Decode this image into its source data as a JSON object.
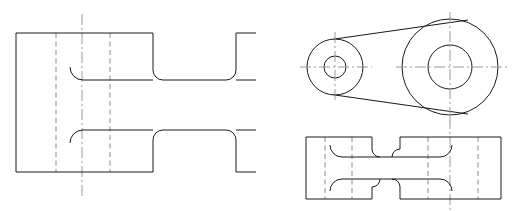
{
  "document": {
    "type": "engineering-drawing",
    "title": "Multiview Orthographic Projection — Connecting Link",
    "sheet_width": 512,
    "sheet_height": 211,
    "background_color": "#ffffff",
    "projection": "third-angle",
    "view_count": 3
  },
  "style": {
    "visible_edge_color": "#1a1a1a",
    "hidden_edge_color": "#8a8a8a",
    "center_line_color": "#9a9a9a",
    "line_width": 1,
    "hidden_dash": "5 3.5",
    "center_dash": "11 3 2 3"
  },
  "views": {
    "front": {
      "name": "front-section-view",
      "label": "",
      "origin_x": 16,
      "origin_y": 33,
      "outline_path": "M16,33 L153,33 L153,70 Q153,80 163,80 L226,80 Q236,80 236,70 L236,33 L256,33 M256,80 L236,80 M16,33 L16,172 L153,172 L153,140 Q153,130 163,130 L226,130 Q236,130 236,140 L236,172 L256,172 M256,130 L236,130",
      "segments": [
        {
          "name": "top-edge-left",
          "type": "line",
          "x1": 16,
          "y1": 33,
          "x2": 153,
          "y2": 33
        },
        {
          "name": "bottom-edge-left",
          "type": "line",
          "x1": 16,
          "y1": 172,
          "x2": 153,
          "y2": 172
        },
        {
          "name": "left-edge",
          "type": "line",
          "x1": 16,
          "y1": 33,
          "x2": 16,
          "y2": 172
        },
        {
          "name": "upper-step-vertical",
          "type": "line",
          "x1": 153,
          "y1": 33,
          "x2": 153,
          "y2": 72
        },
        {
          "name": "upper-step-fillet",
          "type": "arc",
          "cx": 163,
          "cy": 70,
          "r": 10
        },
        {
          "name": "upper-waist-line",
          "type": "line",
          "x1": 163,
          "y1": 80,
          "x2": 226,
          "y2": 80
        },
        {
          "name": "upper-rise-fillet",
          "type": "arc",
          "cx": 226,
          "cy": 70,
          "r": 10
        },
        {
          "name": "upper-rise-vertical",
          "type": "line",
          "x1": 236,
          "y1": 70,
          "x2": 236,
          "y2": 33
        },
        {
          "name": "upper-right-top",
          "type": "line",
          "x1": 236,
          "y1": 33,
          "x2": 256,
          "y2": 33
        },
        {
          "name": "upper-right-waist",
          "type": "line",
          "x1": 236,
          "y1": 80,
          "x2": 256,
          "y2": 80
        },
        {
          "name": "lower-step-vertical",
          "type": "line",
          "x1": 153,
          "y1": 172,
          "x2": 153,
          "y2": 140
        },
        {
          "name": "lower-step-fillet",
          "type": "arc",
          "cx": 163,
          "cy": 140,
          "r": 10
        },
        {
          "name": "lower-waist-line",
          "type": "line",
          "x1": 163,
          "y1": 130,
          "x2": 226,
          "y2": 130
        },
        {
          "name": "lower-rise-fillet",
          "type": "arc",
          "cx": 226,
          "cy": 140,
          "r": 10
        },
        {
          "name": "lower-rise-vertical",
          "type": "line",
          "x1": 236,
          "y1": 140,
          "x2": 236,
          "y2": 172
        },
        {
          "name": "lower-right-bottom",
          "type": "line",
          "x1": 236,
          "y1": 172,
          "x2": 256,
          "y2": 172
        },
        {
          "name": "lower-right-waist",
          "type": "line",
          "x1": 236,
          "y1": 130,
          "x2": 256,
          "y2": 130
        }
      ],
      "hidden_edges": [
        {
          "name": "hidden-bore-left",
          "x": 56,
          "y1": 33,
          "y2": 172
        },
        {
          "name": "hidden-bore-right",
          "x": 110,
          "y1": 33,
          "y2": 172
        }
      ],
      "interior_fillets": [
        {
          "name": "interior-upper-fillet",
          "cx": 70,
          "cy": 80,
          "r": 10,
          "start_deg": 270,
          "end_deg": 360
        },
        {
          "name": "interior-lower-fillet",
          "cx": 70,
          "cy": 130,
          "r": 10,
          "start_deg": 0,
          "end_deg": 90
        }
      ],
      "interior_lines": [
        {
          "name": "interior-upper-waist",
          "x1": 80,
          "y1": 80,
          "x2": 153,
          "y2": 80
        },
        {
          "name": "interior-lower-waist",
          "x1": 80,
          "y1": 130,
          "x2": 153,
          "y2": 130
        }
      ],
      "center_lines": [
        {
          "name": "front-vertical-centerline",
          "x1": 82,
          "y1": 14,
          "x2": 82,
          "y2": 196
        }
      ]
    },
    "top": {
      "name": "top-plan-view",
      "label": "",
      "small_hub": {
        "name": "small-hub",
        "center_x": 335,
        "center_y": 67,
        "outer_radius": 28,
        "bore_radius": 11
      },
      "large_hub": {
        "name": "large-hub",
        "center_x": 450,
        "center_y": 67,
        "outer_radius": 48,
        "bore_radius": 22
      },
      "tangent_lines": [
        {
          "name": "upper-tangent-web",
          "x1": 334,
          "y1": 39,
          "x2": 467,
          "y2": 20
        },
        {
          "name": "lower-tangent-web",
          "x1": 334,
          "y1": 95,
          "x2": 467,
          "y2": 114
        }
      ],
      "center_lines": [
        {
          "name": "small-hub-horizontal-centerline",
          "x1": 301,
          "y1": 67,
          "x2": 372,
          "y2": 67
        },
        {
          "name": "small-hub-vertical-centerline",
          "x1": 335,
          "y1": 33,
          "x2": 335,
          "y2": 101
        },
        {
          "name": "large-hub-horizontal-centerline",
          "x1": 396,
          "y1": 67,
          "x2": 507,
          "y2": 67
        },
        {
          "name": "large-hub-vertical-centerline",
          "x1": 450,
          "y1": 13,
          "x2": 450,
          "y2": 121
        }
      ]
    },
    "side": {
      "name": "side-section-view",
      "label": "",
      "origin_x": 306,
      "origin_y": 137,
      "width": 195,
      "height": 62,
      "outline": {
        "x": 306,
        "y": 137,
        "w": 195,
        "h": 62
      },
      "segments": [
        {
          "name": "outer-top-left",
          "type": "line",
          "x1": 306,
          "y1": 137,
          "x2": 372,
          "y2": 137
        },
        {
          "name": "outer-top-right",
          "type": "line",
          "x1": 400,
          "y1": 137,
          "x2": 501,
          "y2": 137
        },
        {
          "name": "outer-bottom-left",
          "type": "line",
          "x1": 306,
          "y1": 199,
          "x2": 372,
          "y2": 199
        },
        {
          "name": "outer-bottom-right",
          "type": "line",
          "x1": 400,
          "y1": 199,
          "x2": 501,
          "y2": 199
        },
        {
          "name": "outer-left-edge",
          "type": "line",
          "x1": 306,
          "y1": 137,
          "x2": 306,
          "y2": 199
        },
        {
          "name": "outer-right-edge",
          "type": "line",
          "x1": 501,
          "y1": 137,
          "x2": 501,
          "y2": 199
        },
        {
          "name": "notch-left-vertical-upper",
          "type": "line",
          "x1": 372,
          "y1": 137,
          "x2": 372,
          "y2": 152
        },
        {
          "name": "notch-right-vertical-upper",
          "type": "line",
          "x1": 400,
          "y1": 137,
          "x2": 400,
          "y2": 152
        },
        {
          "name": "notch-left-vertical-lower",
          "type": "line",
          "x1": 372,
          "y1": 199,
          "x2": 372,
          "y2": 184
        },
        {
          "name": "notch-right-vertical-lower",
          "type": "line",
          "x1": 400,
          "y1": 199,
          "x2": 400,
          "y2": 184
        },
        {
          "name": "web-top-line",
          "type": "line",
          "x1": 338,
          "y1": 157,
          "x2": 451,
          "y2": 157
        },
        {
          "name": "web-bottom-line",
          "type": "line",
          "x1": 338,
          "y1": 179,
          "x2": 451,
          "y2": 179
        }
      ],
      "hidden_edges": [
        {
          "name": "hidden-line-a",
          "x": 325,
          "y1": 137,
          "y2": 199
        },
        {
          "name": "hidden-line-b",
          "x": 352,
          "y1": 137,
          "y2": 199
        },
        {
          "name": "hidden-line-c",
          "x": 428,
          "y1": 137,
          "y2": 199
        },
        {
          "name": "hidden-line-d",
          "x": 478,
          "y1": 137,
          "y2": 199
        }
      ],
      "center_lines": [
        {
          "name": "side-vertical-centerline",
          "x1": 450,
          "y1": 118,
          "x2": 450,
          "y2": 211
        }
      ]
    }
  }
}
